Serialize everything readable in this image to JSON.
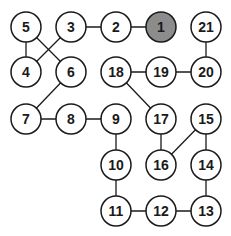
{
  "diagram": {
    "node_radius": 15,
    "colors": {
      "stroke": "#1a1a1a",
      "fill": "#ffffff",
      "highlight_fill": "#8c8c8c",
      "edge": "#1a1a1a"
    },
    "nodes": [
      {
        "id": "1",
        "x": 161,
        "y": 27,
        "highlight": true
      },
      {
        "id": "2",
        "x": 116,
        "y": 27
      },
      {
        "id": "3",
        "x": 71,
        "y": 27
      },
      {
        "id": "4",
        "x": 26,
        "y": 72
      },
      {
        "id": "5",
        "x": 26,
        "y": 27
      },
      {
        "id": "6",
        "x": 71,
        "y": 72
      },
      {
        "id": "7",
        "x": 26,
        "y": 119
      },
      {
        "id": "8",
        "x": 71,
        "y": 119
      },
      {
        "id": "9",
        "x": 116,
        "y": 119
      },
      {
        "id": "10",
        "x": 116,
        "y": 165
      },
      {
        "id": "11",
        "x": 116,
        "y": 211
      },
      {
        "id": "12",
        "x": 161,
        "y": 211
      },
      {
        "id": "13",
        "x": 206,
        "y": 211
      },
      {
        "id": "14",
        "x": 206,
        "y": 165
      },
      {
        "id": "15",
        "x": 206,
        "y": 119
      },
      {
        "id": "16",
        "x": 161,
        "y": 165
      },
      {
        "id": "17",
        "x": 161,
        "y": 119
      },
      {
        "id": "18",
        "x": 116,
        "y": 72
      },
      {
        "id": "19",
        "x": 161,
        "y": 72
      },
      {
        "id": "20",
        "x": 206,
        "y": 72
      },
      {
        "id": "21",
        "x": 206,
        "y": 27
      }
    ],
    "edges": [
      [
        "1",
        "2"
      ],
      [
        "2",
        "3"
      ],
      [
        "3",
        "4"
      ],
      [
        "5",
        "4"
      ],
      [
        "5",
        "6"
      ],
      [
        "6",
        "7"
      ],
      [
        "7",
        "8"
      ],
      [
        "8",
        "9"
      ],
      [
        "9",
        "10"
      ],
      [
        "10",
        "11"
      ],
      [
        "11",
        "12"
      ],
      [
        "12",
        "13"
      ],
      [
        "13",
        "14"
      ],
      [
        "14",
        "15"
      ],
      [
        "15",
        "16"
      ],
      [
        "16",
        "17"
      ],
      [
        "17",
        "18"
      ],
      [
        "18",
        "19"
      ],
      [
        "19",
        "20"
      ],
      [
        "20",
        "21"
      ]
    ]
  }
}
